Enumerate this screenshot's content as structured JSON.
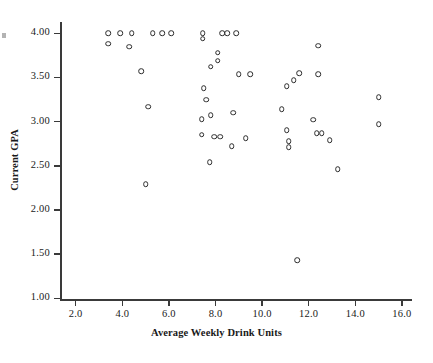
{
  "chart_data": {
    "type": "scatter",
    "title": "",
    "xlabel": "Average Weekly Drink Units",
    "ylabel": "Current GPA",
    "xlim": [
      1.0,
      16.9
    ],
    "ylim": [
      0.84,
      4.14
    ],
    "xticks": [
      "2.0",
      "4.0",
      "6.0",
      "8.0",
      "10.0",
      "12.0",
      "14.0",
      "16.0"
    ],
    "xtick_values": [
      2.0,
      4.0,
      6.0,
      8.0,
      10.0,
      12.0,
      14.0,
      16.0
    ],
    "yticks": [
      "1.00",
      "1.50",
      "2.00",
      "2.50",
      "3.00",
      "3.50",
      "4.00"
    ],
    "ytick_values": [
      1.0,
      1.5,
      2.0,
      2.5,
      3.0,
      3.5,
      4.0
    ],
    "grid": false,
    "legend": null,
    "marker": "open-circle",
    "marker_color": "#2b2b2b",
    "points": [
      {
        "x": 3.4,
        "y": 4.0
      },
      {
        "x": 3.9,
        "y": 4.0
      },
      {
        "x": 4.4,
        "y": 4.0
      },
      {
        "x": 5.3,
        "y": 4.0
      },
      {
        "x": 5.7,
        "y": 4.0
      },
      {
        "x": 6.1,
        "y": 4.0
      },
      {
        "x": 3.4,
        "y": 3.88
      },
      {
        "x": 4.3,
        "y": 3.85
      },
      {
        "x": 4.8,
        "y": 3.57
      },
      {
        "x": 5.1,
        "y": 3.17
      },
      {
        "x": 5.0,
        "y": 2.29
      },
      {
        "x": 7.45,
        "y": 4.0
      },
      {
        "x": 7.45,
        "y": 3.94
      },
      {
        "x": 8.3,
        "y": 4.0
      },
      {
        "x": 8.5,
        "y": 4.0
      },
      {
        "x": 8.9,
        "y": 4.0
      },
      {
        "x": 8.1,
        "y": 3.78
      },
      {
        "x": 8.1,
        "y": 3.69
      },
      {
        "x": 7.8,
        "y": 3.62
      },
      {
        "x": 9.0,
        "y": 3.54
      },
      {
        "x": 9.5,
        "y": 3.54
      },
      {
        "x": 7.5,
        "y": 3.38
      },
      {
        "x": 7.6,
        "y": 3.25
      },
      {
        "x": 7.4,
        "y": 3.03
      },
      {
        "x": 7.8,
        "y": 3.07
      },
      {
        "x": 8.75,
        "y": 3.1
      },
      {
        "x": 10.85,
        "y": 3.14
      },
      {
        "x": 7.4,
        "y": 2.85
      },
      {
        "x": 7.95,
        "y": 2.83
      },
      {
        "x": 8.2,
        "y": 2.83
      },
      {
        "x": 8.7,
        "y": 2.72
      },
      {
        "x": 9.3,
        "y": 2.81
      },
      {
        "x": 7.75,
        "y": 2.54
      },
      {
        "x": 11.05,
        "y": 3.4
      },
      {
        "x": 11.35,
        "y": 3.47
      },
      {
        "x": 11.6,
        "y": 3.55
      },
      {
        "x": 12.4,
        "y": 3.86
      },
      {
        "x": 12.4,
        "y": 3.54
      },
      {
        "x": 11.05,
        "y": 2.9
      },
      {
        "x": 11.15,
        "y": 2.78
      },
      {
        "x": 11.15,
        "y": 2.71
      },
      {
        "x": 12.2,
        "y": 3.02
      },
      {
        "x": 12.35,
        "y": 2.87
      },
      {
        "x": 12.55,
        "y": 2.87
      },
      {
        "x": 12.9,
        "y": 2.79
      },
      {
        "x": 13.25,
        "y": 2.46
      },
      {
        "x": 11.5,
        "y": 1.43
      },
      {
        "x": 15.0,
        "y": 3.28
      },
      {
        "x": 15.0,
        "y": 2.97
      }
    ]
  }
}
